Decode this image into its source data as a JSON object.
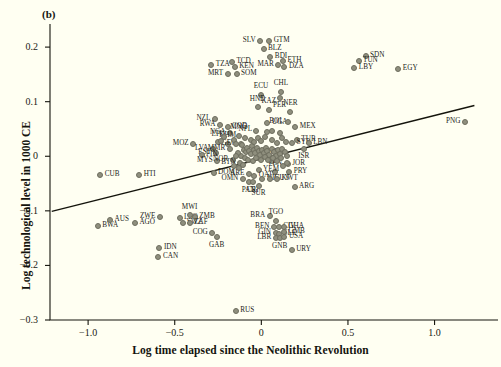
{
  "figure": {
    "panel_label": "(b)",
    "xlabel": "Log time elapsed since the Neolithic Revolution",
    "ylabel": "Log technological level in 1000 CE",
    "background_color": "#FFFFF2",
    "marker_color": "#8f8f7e",
    "line_color": "#14140c"
  },
  "chart_data": {
    "type": "scatter",
    "title": "(b)",
    "xlabel": "Log time elapsed since the Neolithic Revolution",
    "ylabel": "Log technological level in 1000 CE",
    "xlim": [
      -1.22,
      1.32
    ],
    "ylim": [
      -0.3,
      0.235
    ],
    "xticks": [
      -1.0,
      -0.5,
      0,
      0.5,
      1.0
    ],
    "xticklabels": [
      "−1.0",
      "−0.5",
      "0",
      "0.5",
      "1.0"
    ],
    "yticks": [
      0.2,
      0.1,
      0,
      -0.1,
      -0.2,
      -0.3
    ],
    "yticklabels": [
      "0.2",
      "0.1",
      "0",
      "−0.1",
      "−0.2",
      "−0.3"
    ],
    "grid": false,
    "legend": null,
    "fit_line": {
      "type": "linear",
      "x0": -1.21,
      "y0": -0.101,
      "x1": 1.23,
      "y1": 0.093
    },
    "points": [
      {
        "label": "GTM",
        "x": 0.045,
        "y": 0.211,
        "lp": "right"
      },
      {
        "label": "SLV",
        "x": -0.007,
        "y": 0.211,
        "lp": "left"
      },
      {
        "label": "BLZ",
        "x": 0.013,
        "y": 0.196,
        "lp": "right"
      },
      {
        "label": "BDI",
        "x": 0.052,
        "y": 0.182,
        "lp": "right"
      },
      {
        "label": "ETH",
        "x": 0.125,
        "y": 0.175,
        "lp": "right"
      },
      {
        "label": "MAR",
        "x": 0.098,
        "y": 0.168,
        "lp": "left"
      },
      {
        "label": "DZA",
        "x": 0.133,
        "y": 0.163,
        "lp": "right"
      },
      {
        "label": "TZA",
        "x": -0.289,
        "y": 0.168,
        "lp": "right"
      },
      {
        "label": "TCD",
        "x": -0.17,
        "y": 0.173,
        "lp": "right"
      },
      {
        "label": "KEN",
        "x": -0.154,
        "y": 0.163,
        "lp": "right"
      },
      {
        "label": "MRT",
        "x": -0.195,
        "y": 0.15,
        "lp": "left"
      },
      {
        "label": "SOM",
        "x": -0.143,
        "y": 0.15,
        "lp": "right"
      },
      {
        "label": "SDN",
        "x": 0.602,
        "y": 0.183,
        "lp": "right"
      },
      {
        "label": "TUN",
        "x": 0.561,
        "y": 0.174,
        "lp": "right"
      },
      {
        "label": "LBY",
        "x": 0.537,
        "y": 0.161,
        "lp": "right"
      },
      {
        "label": "EGY",
        "x": 0.791,
        "y": 0.159,
        "lp": "right"
      },
      {
        "label": "PNG",
        "x": 1.175,
        "y": 0.062,
        "lp": "left"
      },
      {
        "label": "ECU",
        "x": -0.002,
        "y": 0.113,
        "lp": "top"
      },
      {
        "label": "CHL",
        "x": 0.113,
        "y": 0.118,
        "lp": "top"
      },
      {
        "label": "PER",
        "x": 0.105,
        "y": 0.107,
        "lp": "bottom"
      },
      {
        "label": "KAZ",
        "x": 0.043,
        "y": 0.085,
        "lp": "top"
      },
      {
        "label": "HND",
        "x": -0.022,
        "y": 0.09,
        "lp": "top"
      },
      {
        "label": "NER",
        "x": 0.168,
        "y": 0.082,
        "lp": "top"
      },
      {
        "label": "NZL",
        "x": -0.268,
        "y": 0.068,
        "lp": "left"
      },
      {
        "label": "RWA",
        "x": -0.239,
        "y": 0.057,
        "lp": "left"
      },
      {
        "label": "COD",
        "x": -0.195,
        "y": 0.054,
        "lp": "right"
      },
      {
        "label": "NGA",
        "x": -0.181,
        "y": 0.043,
        "lp": "left"
      },
      {
        "label": "UGA",
        "x": 0.035,
        "y": 0.061,
        "lp": "right"
      },
      {
        "label": "MEX",
        "x": 0.196,
        "y": 0.053,
        "lp": "right"
      },
      {
        "label": "BOL",
        "x": 0.155,
        "y": 0.062,
        "lp": "left"
      },
      {
        "label": "MNG",
        "x": -0.131,
        "y": 0.038,
        "lp": "top"
      },
      {
        "label": "NPL",
        "x": -0.092,
        "y": 0.034,
        "lp": "top"
      },
      {
        "label": "TUR",
        "x": 0.205,
        "y": 0.03,
        "lp": "right"
      },
      {
        "label": "SYR",
        "x": 0.178,
        "y": 0.024,
        "lp": "right"
      },
      {
        "label": "LBN",
        "x": 0.273,
        "y": 0.025,
        "lp": "right"
      },
      {
        "label": "ISR",
        "x": 0.245,
        "y": 0.014,
        "lp": "bottom"
      },
      {
        "label": "MOZ",
        "x": -0.393,
        "y": 0.023,
        "lp": "left"
      },
      {
        "label": "LTU",
        "x": -0.25,
        "y": 0.026,
        "lp": "top"
      },
      {
        "label": "KHM",
        "x": -0.194,
        "y": 0.023,
        "lp": "top"
      },
      {
        "label": "LVA",
        "x": -0.281,
        "y": 0.014,
        "lp": "left"
      },
      {
        "label": "MMR",
        "x": -0.182,
        "y": 0.014,
        "lp": "left"
      },
      {
        "label": "EST",
        "x": -0.264,
        "y": 0.006,
        "lp": "left"
      },
      {
        "label": "FIN",
        "x": -0.345,
        "y": 0.002,
        "lp": "right"
      },
      {
        "label": "MYS",
        "x": -0.255,
        "y": -0.008,
        "lp": "left"
      },
      {
        "label": "NOR",
        "x": -0.165,
        "y": -0.007,
        "lp": "left"
      },
      {
        "label": "BTN",
        "x": -0.122,
        "y": -0.013,
        "lp": "left"
      },
      {
        "label": "GEO",
        "x": -0.118,
        "y": 0.023,
        "lp": "left"
      },
      {
        "label": "SVN",
        "x": 0.062,
        "y": -0.008,
        "lp": "top"
      },
      {
        "label": "JOR",
        "x": 0.152,
        "y": -0.014,
        "lp": "right"
      },
      {
        "label": "VEN",
        "x": 0.077,
        "y": -0.028,
        "lp": "top"
      },
      {
        "label": "PRY",
        "x": 0.161,
        "y": -0.029,
        "lp": "right"
      },
      {
        "label": "YEM",
        "x": -0.016,
        "y": -0.025,
        "lp": "right"
      },
      {
        "label": "ARE",
        "x": -0.072,
        "y": -0.033,
        "lp": "left"
      },
      {
        "label": "QAT",
        "x": -0.041,
        "y": -0.037,
        "lp": "right"
      },
      {
        "label": "OMN",
        "x": -0.107,
        "y": -0.041,
        "lp": "left"
      },
      {
        "label": "PAN",
        "x": -0.074,
        "y": -0.048,
        "lp": "bottom"
      },
      {
        "label": "CRI",
        "x": -0.05,
        "y": -0.048,
        "lp": "bottom"
      },
      {
        "label": "SUR",
        "x": -0.016,
        "y": -0.054,
        "lp": "bottom"
      },
      {
        "label": "NIC",
        "x": 0.006,
        "y": -0.041,
        "lp": "right"
      },
      {
        "label": "GUY",
        "x": 0.048,
        "y": -0.041,
        "lp": "right"
      },
      {
        "label": "KWT",
        "x": 0.091,
        "y": -0.041,
        "lp": "right"
      },
      {
        "label": "ARG",
        "x": 0.192,
        "y": -0.057,
        "lp": "right"
      },
      {
        "label": "CUB",
        "x": -0.93,
        "y": -0.034,
        "lp": "right"
      },
      {
        "label": "HTI",
        "x": -0.705,
        "y": -0.034,
        "lp": "right"
      },
      {
        "label": "DOM",
        "x": -0.276,
        "y": -0.031,
        "lp": "right"
      },
      {
        "label": "BWA",
        "x": -0.945,
        "y": -0.127,
        "lp": "right"
      },
      {
        "label": "AUS",
        "x": -0.873,
        "y": -0.117,
        "lp": "right"
      },
      {
        "label": "AGO",
        "x": -0.73,
        "y": -0.122,
        "lp": "right"
      },
      {
        "label": "ZWE",
        "x": -0.585,
        "y": -0.111,
        "lp": "left"
      },
      {
        "label": "LSO",
        "x": -0.472,
        "y": -0.114,
        "lp": "right"
      },
      {
        "label": "SWZ",
        "x": -0.455,
        "y": -0.123,
        "lp": "right"
      },
      {
        "label": "MWI",
        "x": -0.414,
        "y": -0.108,
        "lp": "top"
      },
      {
        "label": "ZMB",
        "x": -0.385,
        "y": -0.112,
        "lp": "right"
      },
      {
        "label": "ZAF",
        "x": -0.414,
        "y": -0.123,
        "lp": "right"
      },
      {
        "label": "COG",
        "x": -0.283,
        "y": -0.141,
        "lp": "left"
      },
      {
        "label": "GAB",
        "x": -0.258,
        "y": -0.148,
        "lp": "bottom"
      },
      {
        "label": "IDN",
        "x": -0.588,
        "y": -0.168,
        "lp": "right"
      },
      {
        "label": "CAN",
        "x": -0.594,
        "y": -0.184,
        "lp": "right"
      },
      {
        "label": "BRA",
        "x": 0.048,
        "y": -0.11,
        "lp": "left"
      },
      {
        "label": "TGO",
        "x": 0.084,
        "y": -0.118,
        "lp": "top"
      },
      {
        "label": "BEN",
        "x": 0.073,
        "y": -0.13,
        "lp": "left"
      },
      {
        "label": "CIV",
        "x": 0.1,
        "y": -0.13,
        "lp": "right"
      },
      {
        "label": "GHA",
        "x": 0.13,
        "y": -0.13,
        "lp": "right"
      },
      {
        "label": "GIN",
        "x": 0.082,
        "y": -0.14,
        "lp": "left"
      },
      {
        "label": "SLE",
        "x": 0.102,
        "y": -0.142,
        "lp": "right"
      },
      {
        "label": "GMB",
        "x": 0.131,
        "y": -0.139,
        "lp": "right"
      },
      {
        "label": "LBR",
        "x": 0.083,
        "y": -0.15,
        "lp": "left"
      },
      {
        "label": "GNB",
        "x": 0.106,
        "y": -0.15,
        "lp": "bottom"
      },
      {
        "label": "USA",
        "x": 0.133,
        "y": -0.148,
        "lp": "right"
      },
      {
        "label": "URY",
        "x": 0.175,
        "y": -0.171,
        "lp": "right"
      },
      {
        "label": "RUS",
        "x": -0.148,
        "y": -0.283,
        "lp": "right"
      },
      {
        "label": "",
        "x": -0.11,
        "y": 0.02,
        "lp": "none"
      },
      {
        "label": "",
        "x": -0.1,
        "y": 0.012,
        "lp": "none"
      },
      {
        "label": "",
        "x": -0.09,
        "y": 0.008,
        "lp": "none"
      },
      {
        "label": "",
        "x": -0.08,
        "y": 0.016,
        "lp": "none"
      },
      {
        "label": "",
        "x": -0.07,
        "y": 0.01,
        "lp": "none"
      },
      {
        "label": "",
        "x": -0.06,
        "y": 0.004,
        "lp": "none"
      },
      {
        "label": "",
        "x": -0.055,
        "y": 0.018,
        "lp": "none"
      },
      {
        "label": "",
        "x": -0.045,
        "y": 0.012,
        "lp": "none"
      },
      {
        "label": "",
        "x": -0.035,
        "y": 0.006,
        "lp": "none"
      },
      {
        "label": "",
        "x": -0.025,
        "y": 0.015,
        "lp": "none"
      },
      {
        "label": "",
        "x": -0.015,
        "y": 0.009,
        "lp": "none"
      },
      {
        "label": "",
        "x": -0.005,
        "y": 0.003,
        "lp": "none"
      },
      {
        "label": "",
        "x": 0.005,
        "y": 0.012,
        "lp": "none"
      },
      {
        "label": "",
        "x": 0.015,
        "y": 0.006,
        "lp": "none"
      },
      {
        "label": "",
        "x": 0.025,
        "y": 0.016,
        "lp": "none"
      },
      {
        "label": "",
        "x": 0.035,
        "y": 0.009,
        "lp": "none"
      },
      {
        "label": "",
        "x": 0.045,
        "y": 0.003,
        "lp": "none"
      },
      {
        "label": "",
        "x": 0.06,
        "y": 0.014,
        "lp": "none"
      },
      {
        "label": "",
        "x": 0.072,
        "y": 0.007,
        "lp": "none"
      },
      {
        "label": "",
        "x": 0.085,
        "y": 0.001,
        "lp": "none"
      },
      {
        "label": "",
        "x": 0.098,
        "y": 0.011,
        "lp": "none"
      },
      {
        "label": "",
        "x": 0.11,
        "y": 0.004,
        "lp": "none"
      },
      {
        "label": "",
        "x": 0.122,
        "y": 0.014,
        "lp": "none"
      },
      {
        "label": "",
        "x": 0.135,
        "y": 0.008,
        "lp": "none"
      },
      {
        "label": "",
        "x": 0.148,
        "y": 0.0,
        "lp": "none"
      },
      {
        "label": "",
        "x": -0.12,
        "y": 0.0,
        "lp": "none"
      },
      {
        "label": "",
        "x": -0.135,
        "y": 0.006,
        "lp": "none"
      },
      {
        "label": "",
        "x": -0.148,
        "y": 0.0,
        "lp": "none"
      },
      {
        "label": "",
        "x": -0.095,
        "y": -0.004,
        "lp": "none"
      },
      {
        "label": "",
        "x": -0.075,
        "y": -0.006,
        "lp": "none"
      },
      {
        "label": "",
        "x": -0.05,
        "y": -0.008,
        "lp": "none"
      },
      {
        "label": "",
        "x": -0.03,
        "y": -0.004,
        "lp": "none"
      },
      {
        "label": "",
        "x": 0.0,
        "y": -0.006,
        "lp": "none"
      },
      {
        "label": "",
        "x": 0.02,
        "y": -0.002,
        "lp": "none"
      },
      {
        "label": "",
        "x": 0.04,
        "y": -0.006,
        "lp": "none"
      },
      {
        "label": "",
        "x": 0.065,
        "y": -0.003,
        "lp": "none"
      },
      {
        "label": "",
        "x": 0.09,
        "y": -0.008,
        "lp": "none"
      },
      {
        "label": "",
        "x": 0.115,
        "y": -0.004,
        "lp": "none"
      },
      {
        "label": "",
        "x": -0.16,
        "y": 0.03,
        "lp": "none"
      },
      {
        "label": "",
        "x": -0.145,
        "y": 0.022,
        "lp": "none"
      },
      {
        "label": "",
        "x": -0.06,
        "y": 0.03,
        "lp": "none"
      },
      {
        "label": "",
        "x": -0.04,
        "y": 0.026,
        "lp": "none"
      },
      {
        "label": "",
        "x": -0.02,
        "y": 0.034,
        "lp": "none"
      },
      {
        "label": "",
        "x": 0.0,
        "y": 0.028,
        "lp": "none"
      },
      {
        "label": "",
        "x": 0.02,
        "y": 0.036,
        "lp": "none"
      },
      {
        "label": "",
        "x": 0.06,
        "y": 0.03,
        "lp": "none"
      },
      {
        "label": "",
        "x": 0.09,
        "y": 0.024,
        "lp": "none"
      },
      {
        "label": "",
        "x": 0.12,
        "y": 0.034,
        "lp": "none"
      },
      {
        "label": "",
        "x": 0.145,
        "y": 0.026,
        "lp": "none"
      },
      {
        "label": "",
        "x": -0.215,
        "y": 0.036,
        "lp": "none"
      },
      {
        "label": "",
        "x": -0.23,
        "y": 0.028,
        "lp": "none"
      },
      {
        "label": "",
        "x": 0.03,
        "y": 0.044,
        "lp": "none"
      },
      {
        "label": "",
        "x": 0.06,
        "y": 0.046,
        "lp": "none"
      },
      {
        "label": "",
        "x": -0.03,
        "y": 0.046,
        "lp": "none"
      },
      {
        "label": "",
        "x": 0.11,
        "y": 0.042,
        "lp": "none"
      },
      {
        "label": "",
        "x": -0.155,
        "y": -0.018,
        "lp": "none"
      },
      {
        "label": "",
        "x": -0.13,
        "y": -0.022,
        "lp": "none"
      },
      {
        "label": "",
        "x": -0.105,
        "y": -0.016,
        "lp": "none"
      },
      {
        "label": "",
        "x": 0.125,
        "y": -0.018,
        "lp": "none"
      },
      {
        "label": "",
        "x": 0.15,
        "y": -0.012,
        "lp": "none"
      }
    ]
  }
}
